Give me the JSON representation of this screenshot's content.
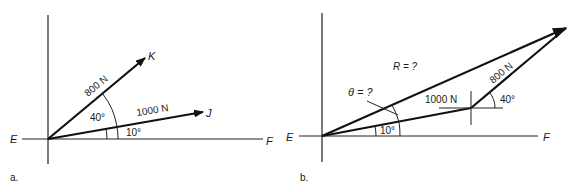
{
  "panel_a": {
    "caption": "a.",
    "axis_left_label": "E",
    "axis_right_label": "F",
    "vector_k": {
      "label": "800 N",
      "endpoint_label": "K",
      "angle_label": "40°"
    },
    "vector_j": {
      "label": "1000 N",
      "endpoint_label": "J",
      "angle_label": "10°"
    }
  },
  "panel_b": {
    "caption": "b.",
    "axis_left_label": "E",
    "axis_right_label": "F",
    "resultant_label": "R = ?",
    "theta_label": "θ = ?",
    "vector_1000": {
      "label": "1000 N",
      "angle_label": "10°"
    },
    "vector_800": {
      "label": "800 N",
      "angle_label": "40°"
    }
  }
}
